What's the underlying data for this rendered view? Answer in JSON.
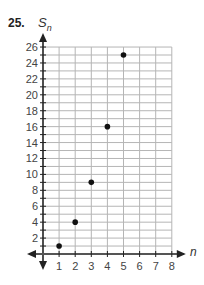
{
  "problem": {
    "number": "25."
  },
  "chart_data": {
    "type": "scatter",
    "title": "",
    "xlabel": "n",
    "ylabel": "S_n",
    "ylabel_main": "S",
    "ylabel_sub": "n",
    "xlim": [
      0,
      8
    ],
    "ylim": [
      0,
      26
    ],
    "grid": true,
    "x_ticks": [
      1,
      2,
      3,
      4,
      5,
      6,
      7,
      8
    ],
    "y_ticks": [
      2,
      4,
      6,
      8,
      10,
      12,
      14,
      16,
      18,
      20,
      22,
      24,
      26
    ],
    "points": [
      {
        "x": 1,
        "y": 1
      },
      {
        "x": 2,
        "y": 4
      },
      {
        "x": 3,
        "y": 9
      },
      {
        "x": 4,
        "y": 16
      },
      {
        "x": 5,
        "y": 25
      }
    ],
    "x": [
      1,
      2,
      3,
      4,
      5
    ],
    "values": [
      1,
      4,
      9,
      16,
      25
    ]
  }
}
